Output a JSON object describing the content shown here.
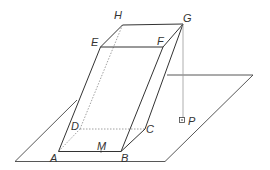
{
  "diagram": {
    "type": "3d-geometry",
    "colors": {
      "stroke": "#333333",
      "hidden": "#888888",
      "projection": "#999999",
      "background": "#ffffff"
    },
    "labels": {
      "A": "A",
      "B": "B",
      "C": "C",
      "D": "D",
      "E": "E",
      "F": "F",
      "G": "G",
      "H": "H",
      "M": "M",
      "P": "P"
    }
  }
}
